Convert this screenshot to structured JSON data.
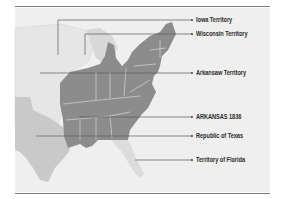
{
  "map": {
    "title": "",
    "colors": {
      "background": "#ffffff",
      "land_panel": "#eeeeee",
      "states_1836": "#8c8c8c",
      "republic_of_texas": "#c9c9c9",
      "territories": "#e4e4e4",
      "great_lakes": "#d6d6d6",
      "leader_lines": "#5a5a5a",
      "rules": "#7a7a7a"
    },
    "labels": [
      {
        "id": "iowa",
        "text": "Iowa Territory",
        "y": 20
      },
      {
        "id": "wisconsin",
        "text": "Wisconsin Territory",
        "y": 34
      },
      {
        "id": "arkansaw",
        "text": "Arkansaw Territory",
        "y": 73
      },
      {
        "id": "arkansas",
        "text": "ARKANSAS 1836",
        "y": 117
      },
      {
        "id": "texas",
        "text": "Republic of Texas",
        "y": 136
      },
      {
        "id": "florida",
        "text": "Territory of Florida",
        "y": 160
      }
    ]
  }
}
